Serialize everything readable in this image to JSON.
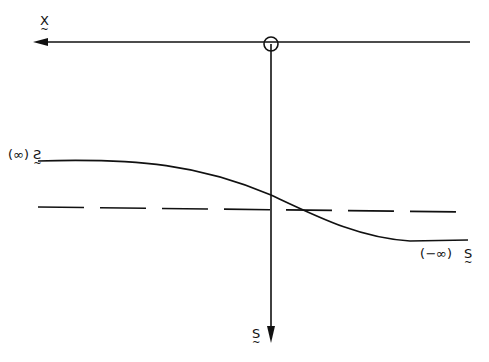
{
  "diagram": {
    "labels": {
      "x_axis": "X",
      "x_axis_tilde": "~",
      "s_axis": "S",
      "s_axis_tilde": "~",
      "s_plus_inf_sym": "S",
      "s_plus_inf_paren": "(∞)",
      "s_minus_inf_sym": "S",
      "s_minus_inf_paren": "(∞−)"
    },
    "colors": {
      "stroke": "#111111",
      "background": "#ffffff"
    }
  }
}
